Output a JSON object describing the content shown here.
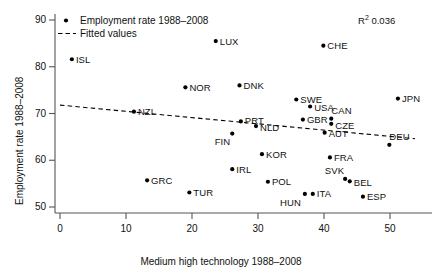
{
  "chart_data": {
    "type": "scatter",
    "title": "",
    "xlabel": "Medium high technology 1988–2008",
    "ylabel": "Employment rate 1988–2008",
    "xlim": [
      -1.5,
      54
    ],
    "ylim": [
      48.0,
      92.5
    ],
    "xticks": [
      0,
      10,
      20,
      30,
      40,
      50
    ],
    "yticks": [
      50,
      60,
      70,
      80,
      90
    ],
    "grid": false,
    "annotation": "R² 0.036",
    "annotation_base": "R",
    "annotation_sup": "2",
    "annotation_value": "0.036",
    "legend": {
      "position": "top-left",
      "entries": [
        {
          "label": "Employment rate 1988–2008",
          "marker": "dot"
        },
        {
          "label": "Fitted values",
          "marker": "dashed-line"
        }
      ]
    },
    "series": [
      {
        "name": "Employment rate 1988–2008",
        "marker": "dot",
        "points": [
          {
            "label": "ISL",
            "x": 1.8,
            "y": 81.6,
            "lx": 4,
            "ly": 0
          },
          {
            "label": "LUX",
            "x": 23.6,
            "y": 85.5,
            "lx": 4,
            "ly": 0
          },
          {
            "label": "CHE",
            "x": 39.9,
            "y": 84.5,
            "lx": 4,
            "ly": 0
          },
          {
            "label": "NOR",
            "x": 19.0,
            "y": 75.6,
            "lx": 4,
            "ly": 0
          },
          {
            "label": "DNK",
            "x": 27.2,
            "y": 76.0,
            "lx": 4,
            "ly": 0
          },
          {
            "label": "JPN",
            "x": 51.2,
            "y": 73.2,
            "lx": 4,
            "ly": 0
          },
          {
            "label": "SWE",
            "x": 35.8,
            "y": 73.0,
            "lx": 4,
            "ly": 0
          },
          {
            "label": "USA",
            "x": 37.9,
            "y": 71.5,
            "lx": 4,
            "ly": 1
          },
          {
            "label": "NZL",
            "x": 11.2,
            "y": 70.4,
            "lx": 4,
            "ly": 0
          },
          {
            "label": "PRT",
            "x": 27.4,
            "y": 68.3,
            "lx": 4,
            "ly": -1
          },
          {
            "label": "NLD",
            "x": 29.7,
            "y": 67.3,
            "lx": 4,
            "ly": 1
          },
          {
            "label": "GBR",
            "x": 36.8,
            "y": 68.7,
            "lx": 4,
            "ly": 0
          },
          {
            "label": "CAN",
            "x": 41.1,
            "y": 68.9,
            "lx": 0,
            "ly": -8
          },
          {
            "label": "CZE",
            "x": 41.1,
            "y": 67.8,
            "lx": 4,
            "ly": 2
          },
          {
            "label": "AUT",
            "x": 40.1,
            "y": 65.9,
            "lx": 4,
            "ly": 1
          },
          {
            "label": "FIN",
            "x": 26.1,
            "y": 65.7,
            "lx": -2,
            "ly": 8
          },
          {
            "label": "DEU",
            "x": 49.9,
            "y": 63.3,
            "lx": 0,
            "ly": -8
          },
          {
            "label": "KOR",
            "x": 30.6,
            "y": 61.3,
            "lx": 4,
            "ly": 0
          },
          {
            "label": "FRA",
            "x": 40.9,
            "y": 60.6,
            "lx": 4,
            "ly": 0
          },
          {
            "label": "IRL",
            "x": 26.1,
            "y": 58.1,
            "lx": 4,
            "ly": 0
          },
          {
            "label": "SVK",
            "x": 43.2,
            "y": 56.0,
            "lx": -1,
            "ly": -8
          },
          {
            "label": "BEL",
            "x": 43.9,
            "y": 55.5,
            "lx": 4,
            "ly": 1
          },
          {
            "label": "POL",
            "x": 31.5,
            "y": 55.4,
            "lx": 4,
            "ly": 0
          },
          {
            "label": "HUN",
            "x": 37.1,
            "y": 52.8,
            "lx": -4,
            "ly": 9
          },
          {
            "label": "ITA",
            "x": 38.3,
            "y": 52.8,
            "lx": 4,
            "ly": 0
          },
          {
            "label": "ESP",
            "x": 45.9,
            "y": 52.2,
            "lx": 4,
            "ly": 0
          },
          {
            "label": "GRC",
            "x": 13.2,
            "y": 55.7,
            "lx": 4,
            "ly": 0
          },
          {
            "label": "TUR",
            "x": 19.6,
            "y": 53.1,
            "lx": 4,
            "ly": 0
          }
        ]
      },
      {
        "name": "Fitted values",
        "marker": "dashed-line",
        "line": {
          "x0": 0.0,
          "y0": 71.8,
          "x1": 53.8,
          "y1": 64.6
        }
      }
    ]
  }
}
